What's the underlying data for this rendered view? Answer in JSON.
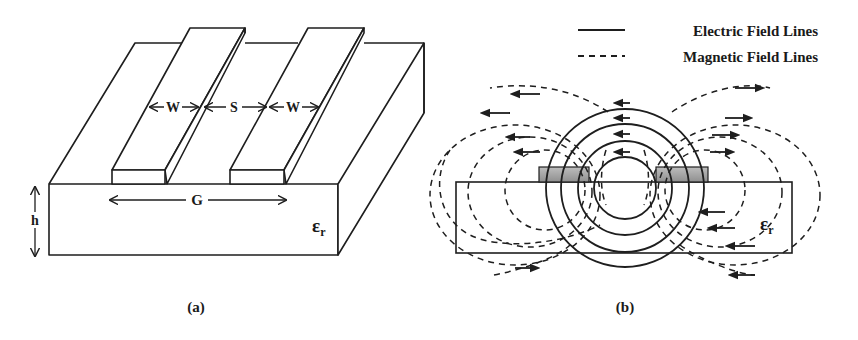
{
  "figure": {
    "panel_a": {
      "caption": "(a)",
      "labels": {
        "strip_width_left": "W",
        "spacing": "S",
        "strip_width_right": "W",
        "gap_total": "G",
        "height": "h",
        "permittivity": "ε",
        "permittivity_sub": "r"
      },
      "description": "Coplanar strips on dielectric substrate (3D view)"
    },
    "panel_b": {
      "caption": "(b)",
      "labels": {
        "permittivity": "ε",
        "permittivity_sub": "r"
      },
      "legend": [
        {
          "style": "solid",
          "label": "Electric Field Lines"
        },
        {
          "style": "dashed",
          "label": "Magnetic Field Lines"
        }
      ],
      "description": "Cross-section field distribution"
    }
  },
  "colors": {
    "line": "#1e1e1e",
    "strip_fill": "#a8a8a8",
    "background": "#ffffff"
  }
}
